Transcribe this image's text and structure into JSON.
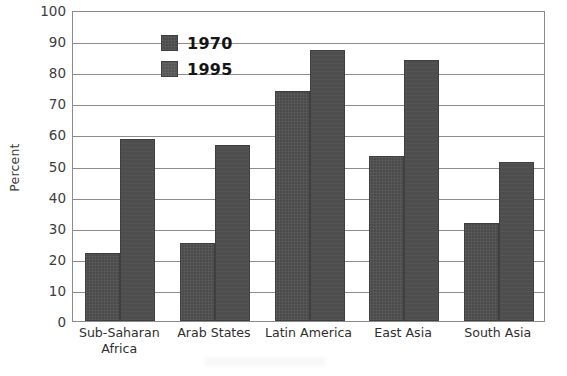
{
  "chart_data": {
    "type": "bar",
    "title": "",
    "xlabel": "",
    "ylabel": "Percent",
    "ylim": [
      0,
      100
    ],
    "yticks": [
      0,
      10,
      20,
      30,
      40,
      50,
      60,
      70,
      80,
      90,
      100
    ],
    "ytick_labels": [
      "0",
      "10",
      "20",
      "30",
      "40",
      "50",
      "60",
      "70",
      "80",
      "90",
      "100"
    ],
    "grid": true,
    "legend_position": "top-left",
    "categories": [
      "Sub-Saharan\nAfrica",
      "Arab States",
      "Latin America",
      "East Asia",
      "South Asia"
    ],
    "series": [
      {
        "name": "1970",
        "color": "#4b4b4b",
        "values": [
          22,
          25,
          74,
          53,
          31.5
        ]
      },
      {
        "name": "1995",
        "color": "#4e4e4e",
        "values": [
          58.5,
          56.5,
          87,
          84,
          51
        ]
      }
    ]
  },
  "legend": {
    "items": [
      {
        "label": "1970"
      },
      {
        "label": "1995"
      }
    ]
  },
  "axes": {
    "y_title": "Percent"
  }
}
